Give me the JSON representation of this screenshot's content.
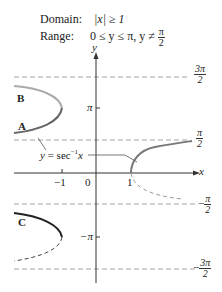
{
  "header": {
    "domain_label": "Domain:",
    "domain_value": "|x| ≥ 1",
    "range_label": "Range:",
    "range_value_prefix": "0 ≤ y ≤ π, y ≠",
    "range_frac_num": "π",
    "range_frac_den": "2"
  },
  "axes": {
    "x_label": "x",
    "y_label": "y",
    "x_ticks": [
      "−1",
      "0",
      "1"
    ],
    "y_ticks": [
      "π",
      "−π"
    ]
  },
  "asymptotes": [
    {
      "num": "3π",
      "den": "2",
      "sign": ""
    },
    {
      "num": "π",
      "den": "2",
      "sign": ""
    },
    {
      "num": "π",
      "den": "2",
      "sign": "−"
    },
    {
      "num": "3π",
      "den": "2",
      "sign": "−"
    }
  ],
  "annotations": {
    "curve_label": "y = sec",
    "curve_label_sup": "−1",
    "curve_label_var": "x",
    "branch_A": "A",
    "branch_B": "B",
    "branch_C": "C"
  },
  "colors": {
    "axis": "#333333",
    "dashed": "#888888",
    "curve_main": "#777777",
    "curve_dark": "#222222"
  }
}
